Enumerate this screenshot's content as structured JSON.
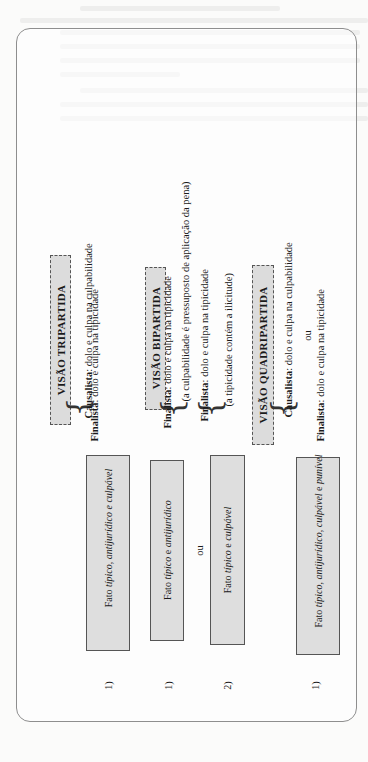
{
  "views": [
    {
      "title": "VISÃO TRIPARTIDA",
      "lines": [
        {
          "school": "Causalista",
          "text": ": dolo e culpa na culpabilidade"
        },
        {
          "school": "Finalista",
          "text": ": dolo e culpa na tipicidade"
        }
      ]
    },
    {
      "title": "VISÃO BIPARTIDA",
      "groups": [
        {
          "school": "Finalista",
          "text": ": dolo e culpa na tipicidade",
          "note": "(a culpabilidade é pressuposto de aplicação da pena)"
        },
        {
          "school": "Finalista",
          "text": ": dolo e culpa na tipicidade",
          "note": "(a tipicidade contém a ilicitude)"
        }
      ]
    },
    {
      "title": "VISÃO QUADRIPARTIDA",
      "lines": [
        {
          "school": "Causalista",
          "text": ": dolo e culpa na culpabilidade"
        },
        {
          "connector": "ou"
        },
        {
          "school": "Finalista",
          "text": ": dolo e culpa na tipicidade"
        }
      ]
    }
  ],
  "facts": [
    {
      "number": "1)",
      "prefix": "Fato ",
      "italic": "típico, antijurídico e culpável"
    },
    {
      "number": "1)",
      "prefix": "Fato ",
      "italic": "típico",
      "mid": " e ",
      "italic2": "antijurídico"
    },
    {
      "connector": "ou"
    },
    {
      "number": "2)",
      "prefix": "Fato ",
      "italic": "típico",
      "mid": " e ",
      "italic2": "culpável"
    },
    {
      "number": "1)",
      "prefix": "Fato ",
      "italic": "típico, antijurídico, culpável",
      "mid": " e ",
      "italic2": "punível"
    }
  ],
  "colors": {
    "box_fill": "#dcdcdc",
    "border": "#555555",
    "frame": "#8e8e8e",
    "page": "#fbfbfa"
  }
}
